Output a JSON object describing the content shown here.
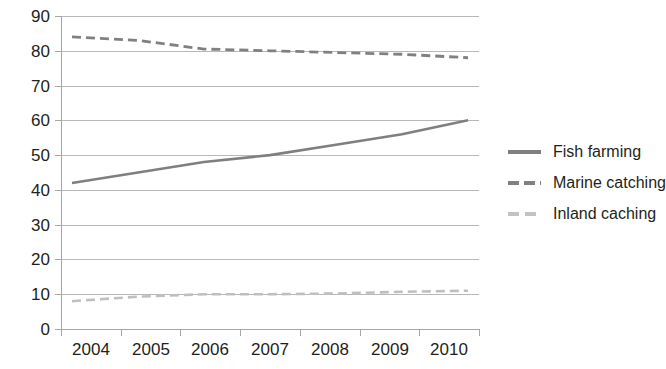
{
  "chart_data": {
    "type": "line",
    "title": "",
    "xlabel": "",
    "ylabel": "",
    "categories": [
      "2004",
      "2005",
      "2006",
      "2007",
      "2008",
      "2009",
      "2010"
    ],
    "x_tick_labels": [
      "2004",
      "2005",
      "2006",
      "2007",
      "2008",
      "2009",
      "2010"
    ],
    "y_tick_labels": [
      "0",
      "10",
      "20",
      "30",
      "40",
      "50",
      "60",
      "70",
      "80",
      "90"
    ],
    "ylim": [
      0,
      90
    ],
    "y_tick_step": 10,
    "grid": "horizontal",
    "legend_position": "right",
    "series": [
      {
        "name": "Fish farming",
        "style": "solid",
        "color": "#7f7f7f",
        "values": [
          42,
          45,
          48,
          50,
          53,
          56,
          60
        ]
      },
      {
        "name": "Marine catching",
        "style": "dashed",
        "color": "#808080",
        "values": [
          84,
          83,
          80.5,
          80,
          79.5,
          79,
          78
        ]
      },
      {
        "name": "Inland caching",
        "style": "dashed",
        "color": "#bfbfbf",
        "values": [
          8,
          9.3,
          10,
          10,
          10.2,
          10.7,
          11
        ]
      }
    ]
  },
  "legend": {
    "items": [
      {
        "label": "Fish farming",
        "swatch": "solid-line-swatch"
      },
      {
        "label": "Marine catching",
        "swatch": "dashed-line-swatch"
      },
      {
        "label": "Inland caching",
        "swatch": "light-dashed-line-swatch"
      }
    ]
  },
  "axes": {
    "y_labels": [
      "90",
      "80",
      "70",
      "60",
      "50",
      "40",
      "30",
      "20",
      "10",
      "0"
    ],
    "x_labels": [
      "2004",
      "2005",
      "2006",
      "2007",
      "2008",
      "2009",
      "2010"
    ]
  }
}
